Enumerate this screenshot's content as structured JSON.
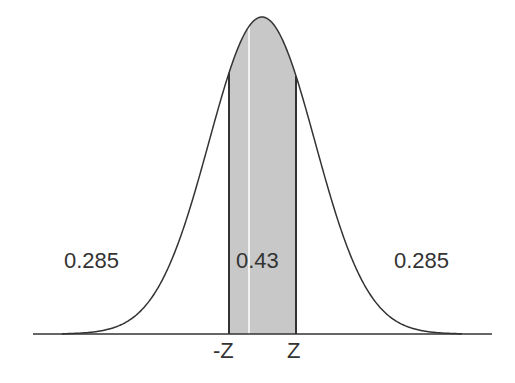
{
  "diagram": {
    "type": "normal-distribution",
    "colors": {
      "background": "#ffffff",
      "curve": "#333333",
      "shade": "#c8c8c8",
      "axis": "#333333",
      "text": "#333333",
      "center_line": "#ffffff"
    },
    "regions": {
      "left_tail": {
        "label": "0.285"
      },
      "center": {
        "label": "0.43"
      },
      "right_tail": {
        "label": "0.285"
      }
    },
    "ticks": {
      "neg_z": "-Z",
      "pos_z": "Z"
    }
  },
  "chart_data": {
    "type": "area",
    "title": "",
    "xlabel": "",
    "ylabel": "",
    "distribution": "normal",
    "areas": [
      {
        "region": "left tail (x < -Z)",
        "value": 0.285
      },
      {
        "region": "center (-Z < x < Z)",
        "value": 0.43
      },
      {
        "region": "right tail (x > Z)",
        "value": 0.285
      }
    ],
    "tick_labels": [
      "-Z",
      "Z"
    ],
    "grid": false,
    "legend": false
  }
}
